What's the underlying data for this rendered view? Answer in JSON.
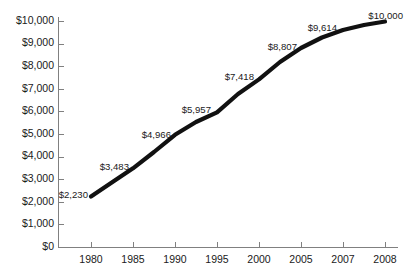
{
  "chart_data": {
    "type": "line",
    "title": "",
    "subtitle": "",
    "xlabel": "",
    "ylabel": "",
    "categories": [
      "1980",
      "1985",
      "1990",
      "1995",
      "2000",
      "2005",
      "2007",
      "2008"
    ],
    "x": [
      1980,
      1985,
      1990,
      1995,
      2000,
      2005,
      2007,
      2008
    ],
    "values": [
      2230,
      3483,
      4966,
      5957,
      7418,
      8807,
      9614,
      10000
    ],
    "point_labels": [
      "$2,230",
      "$3,483",
      "$4,966",
      "$5,957",
      "$7,418",
      "$8,807",
      "$9,614",
      "$10,000"
    ],
    "ylim": [
      0,
      10000
    ],
    "xlim_ticks_equal_spacing": true,
    "ytick_values": [
      0,
      1000,
      2000,
      3000,
      4000,
      5000,
      6000,
      7000,
      8000,
      9000,
      10000
    ],
    "ytick_labels": [
      "$0",
      "$1,000",
      "$2,000",
      "$3,000",
      "$4,000",
      "$5,000",
      "$6,000",
      "$7,000",
      "$8,000",
      "$9,000",
      "$10,000"
    ],
    "xtick_labels": [
      "1980",
      "1985",
      "1990",
      "1995",
      "2000",
      "2005",
      "2007",
      "2008"
    ],
    "grid": false,
    "legend": null,
    "legend_position": "none",
    "series": [
      {
        "name": "",
        "values": [
          2230,
          3483,
          4966,
          5957,
          7418,
          8807,
          9614,
          10000
        ]
      }
    ],
    "colors": {
      "line": "#111111",
      "axis": "#808080",
      "text": "#1a1a1a",
      "background": "#ffffff"
    }
  },
  "labels": {
    "y": [
      {
        "text": "$10,000",
        "x": 54,
        "y": 21
      },
      {
        "text": "$9,000",
        "x": 54,
        "y": 43.6
      },
      {
        "text": "$8,000",
        "x": 54,
        "y": 66.2
      },
      {
        "text": "$7,000",
        "x": 54,
        "y": 88.8
      },
      {
        "text": "$6,000",
        "x": 54,
        "y": 111.4
      },
      {
        "text": "$5,000",
        "x": 54,
        "y": 134
      },
      {
        "text": "$4,000",
        "x": 54,
        "y": 156.6
      },
      {
        "text": "$3,000",
        "x": 54,
        "y": 179.2
      },
      {
        "text": "$2,000",
        "x": 54,
        "y": 201.8
      },
      {
        "text": "$1,000",
        "x": 54,
        "y": 224.4
      },
      {
        "text": "$0",
        "x": 54,
        "y": 247
      }
    ],
    "x": [
      {
        "text": "1980",
        "x": 91,
        "y": 255
      },
      {
        "text": "1985",
        "x": 133,
        "y": 255
      },
      {
        "text": "1990",
        "x": 175,
        "y": 255
      },
      {
        "text": "1995",
        "x": 217,
        "y": 255
      },
      {
        "text": "2000",
        "x": 259,
        "y": 255
      },
      {
        "text": "2005",
        "x": 301,
        "y": 255
      },
      {
        "text": "2007",
        "x": 343,
        "y": 255
      },
      {
        "text": "2008",
        "x": 385,
        "y": 255
      }
    ],
    "points": [
      {
        "text": "$2,230",
        "x": 88,
        "y": 195,
        "anchor": "anchor-end"
      },
      {
        "text": "$3,483",
        "x": 129,
        "y": 167,
        "anchor": "anchor-end"
      },
      {
        "text": "$4,966",
        "x": 171,
        "y": 135,
        "anchor": "anchor-end"
      },
      {
        "text": "$5,957",
        "x": 211,
        "y": 110,
        "anchor": "anchor-end"
      },
      {
        "text": "$7,418",
        "x": 254,
        "y": 77,
        "anchor": "anchor-end"
      },
      {
        "text": "$8,807",
        "x": 297,
        "y": 47,
        "anchor": "anchor-end"
      },
      {
        "text": "$9,614",
        "x": 337,
        "y": 28,
        "anchor": "anchor-end"
      },
      {
        "text": "$10,000",
        "x": 403,
        "y": 16,
        "anchor": "anchor-end"
      }
    ]
  },
  "geometry": {
    "yaxis_path": "M 58.5 17 L 58.5 247.5",
    "xaxis_path": "M 58 247.5 L 398 247.5",
    "data_path": "M 91 196.6 L 114 181 L 133 168.3 L 154 152 L 175 134.8 L 196 122 L 217 112.3 L 238 94 L 259 79.4 L 280 62 L 301 48 L 322 37.5 L 343 30 L 364 25 L 385 21.5",
    "ytick_marks": [
      "M 58 21.5 L 64 21.5",
      "M 58 44.1 L 64 44.1",
      "M 58 66.7 L 64 66.7",
      "M 58 89.3 L 64 89.3",
      "M 58 111.9 L 64 111.9",
      "M 58 134.5 L 64 134.5",
      "M 58 157.1 L 64 157.1",
      "M 58 179.7 L 64 179.7",
      "M 58 202.3 L 64 202.3",
      "M 58 224.9 L 64 224.9"
    ],
    "xtick_marks": [
      "M 91.5 242 L 91.5 248",
      "M 133.5 242 L 133.5 248",
      "M 175.5 242 L 175.5 248",
      "M 217.5 242 L 217.5 248",
      "M 259.5 242 L 259.5 248",
      "M 301.5 242 L 301.5 248",
      "M 343.5 242 L 343.5 248",
      "M 385.5 242 L 385.5 248"
    ]
  }
}
